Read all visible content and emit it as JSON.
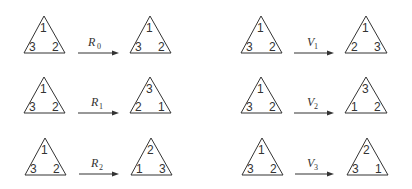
{
  "diagram": {
    "transformations": [
      {
        "name": "R",
        "subscript": "0",
        "before": {
          "top": "1",
          "left": "3",
          "right": "2"
        },
        "after": {
          "top": "1",
          "left": "3",
          "right": "2"
        }
      },
      {
        "name": "R",
        "subscript": "1",
        "before": {
          "top": "1",
          "left": "3",
          "right": "2"
        },
        "after": {
          "top": "3",
          "left": "2",
          "right": "1"
        }
      },
      {
        "name": "R",
        "subscript": "2",
        "before": {
          "top": "1",
          "left": "3",
          "right": "2"
        },
        "after": {
          "top": "2",
          "left": "1",
          "right": "3"
        }
      },
      {
        "name": "V",
        "subscript": "1",
        "before": {
          "top": "1",
          "left": "3",
          "right": "2"
        },
        "after": {
          "top": "1",
          "left": "2",
          "right": "3"
        }
      },
      {
        "name": "V",
        "subscript": "2",
        "before": {
          "top": "1",
          "left": "3",
          "right": "2"
        },
        "after": {
          "top": "3",
          "left": "1",
          "right": "2"
        }
      },
      {
        "name": "V",
        "subscript": "3",
        "before": {
          "top": "1",
          "left": "3",
          "right": "2"
        },
        "after": {
          "top": "2",
          "left": "3",
          "right": "1"
        }
      }
    ]
  }
}
